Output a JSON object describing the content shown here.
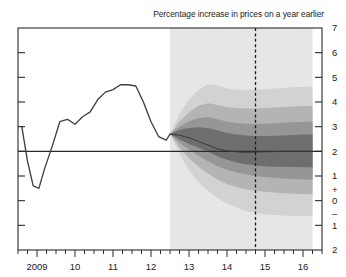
{
  "chart_data": {
    "type": "area",
    "title": "Percentage increase in prices on a year earlier",
    "subtitle": "",
    "xlabel": "",
    "ylabel": "",
    "grid": false,
    "legend_position": "none",
    "ylim": [
      -2,
      7
    ],
    "xlim": [
      2008.5,
      2016.5
    ],
    "y_ticks": [
      "7",
      "6",
      "5",
      "4",
      "3",
      "2",
      "1",
      "0",
      "1",
      "2"
    ],
    "y_tick_values": [
      7,
      6,
      5,
      4,
      3,
      2,
      1,
      0,
      -1,
      -2
    ],
    "y_axis_position": "right",
    "positive_sign": "+",
    "negative_sign": "–",
    "x_ticks": [
      "2009",
      "10",
      "11",
      "12",
      "13",
      "14",
      "15",
      "16"
    ],
    "x_tick_values": [
      2009,
      2010,
      2011,
      2012,
      2013,
      2014,
      2015,
      2016
    ],
    "minor_ticks_per_year": 4,
    "target_line_value": 2,
    "forecast_start": 2012.5,
    "vertical_marker_x": 2014.75,
    "vertical_marker_style": "dashed",
    "forecast_background_start": 2012.5,
    "forecast_background_end": 2016.25,
    "series": [
      {
        "name": "CPI inflation (historical)",
        "type": "line",
        "x": [
          2008.6,
          2008.75,
          2008.9,
          2009.05,
          2009.2,
          2009.4,
          2009.6,
          2009.8,
          2010.0,
          2010.2,
          2010.4,
          2010.6,
          2010.8,
          2011.0,
          2011.2,
          2011.4,
          2011.6,
          2011.8,
          2012.0,
          2012.2,
          2012.4,
          2012.5
        ],
        "values": [
          3.0,
          1.6,
          0.6,
          0.5,
          1.3,
          2.2,
          3.2,
          3.3,
          3.1,
          3.4,
          3.6,
          4.1,
          4.4,
          4.5,
          4.7,
          4.7,
          4.65,
          4.0,
          3.2,
          2.6,
          2.45,
          2.7
        ]
      },
      {
        "name": "Central projection (mode)",
        "type": "line",
        "x": [
          2012.5,
          2012.75,
          2013.0,
          2013.25,
          2013.5,
          2013.75,
          2014.0,
          2014.25,
          2014.5,
          2014.75,
          2015.0,
          2015.25,
          2015.5,
          2015.75,
          2016.0,
          2016.25
        ],
        "values": [
          2.7,
          2.65,
          2.55,
          2.4,
          2.25,
          2.1,
          2.02,
          1.98,
          1.96,
          1.97,
          1.98,
          1.99,
          2.0,
          2.0,
          2.0,
          2.0
        ]
      }
    ],
    "fan_bands": [
      {
        "name": "90% probability band",
        "shade": "#d2d2d2",
        "upper": [
          2.7,
          3.5,
          4.1,
          4.5,
          4.72,
          4.68,
          4.55,
          4.5,
          4.5,
          4.5,
          4.52,
          4.55,
          4.58,
          4.6,
          4.62,
          4.62
        ],
        "lower": [
          2.7,
          1.9,
          1.25,
          0.75,
          0.4,
          0.1,
          -0.1,
          -0.28,
          -0.42,
          -0.5,
          -0.55,
          -0.58,
          -0.6,
          -0.62,
          -0.62,
          -0.62
        ]
      },
      {
        "name": "60% probability band",
        "shade": "#b4b4b4",
        "upper": [
          2.7,
          3.2,
          3.58,
          3.85,
          3.95,
          3.88,
          3.8,
          3.76,
          3.74,
          3.74,
          3.76,
          3.78,
          3.8,
          3.82,
          3.84,
          3.84
        ],
        "lower": [
          2.7,
          2.15,
          1.72,
          1.38,
          1.1,
          0.86,
          0.68,
          0.55,
          0.45,
          0.4,
          0.36,
          0.33,
          0.3,
          0.28,
          0.27,
          0.26
        ]
      },
      {
        "name": "30% probability band",
        "shade": "#969696",
        "upper": [
          2.7,
          3.0,
          3.22,
          3.35,
          3.38,
          3.3,
          3.2,
          3.15,
          3.12,
          3.11,
          3.12,
          3.14,
          3.16,
          3.18,
          3.2,
          3.2
        ],
        "lower": [
          2.7,
          2.35,
          2.06,
          1.82,
          1.6,
          1.4,
          1.25,
          1.14,
          1.06,
          1.0,
          0.96,
          0.93,
          0.9,
          0.88,
          0.86,
          0.85
        ]
      },
      {
        "name": "10% probability band",
        "shade": "#6e6e6e",
        "upper": [
          2.7,
          2.86,
          2.95,
          2.98,
          2.95,
          2.85,
          2.74,
          2.68,
          2.64,
          2.62,
          2.62,
          2.63,
          2.64,
          2.66,
          2.68,
          2.68
        ],
        "lower": [
          2.7,
          2.48,
          2.3,
          2.15,
          1.98,
          1.8,
          1.66,
          1.55,
          1.48,
          1.43,
          1.4,
          1.38,
          1.37,
          1.36,
          1.35,
          1.35
        ]
      }
    ],
    "colors": {
      "forecast_background": "#e6e6e6",
      "line": "#404040",
      "axis": "#2b2b2b",
      "target_line": "#2b2b2b",
      "marker_line": "#1a1a1a"
    }
  }
}
